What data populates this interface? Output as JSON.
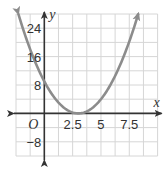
{
  "chart_data": {
    "type": "line",
    "title": "",
    "xlabel": "x",
    "ylabel": "y",
    "origin_label": "O",
    "xlim": [
      -2.5,
      10
    ],
    "ylim": [
      -12,
      28
    ],
    "x_grid_step": 1.25,
    "y_grid_step": 4,
    "grid": true,
    "x_ticks": [
      {
        "value": 2.5,
        "label": "2.5"
      },
      {
        "value": 5,
        "label": "5"
      },
      {
        "value": 7.5,
        "label": "7.5"
      }
    ],
    "y_ticks": [
      {
        "value": 24,
        "label": "24"
      },
      {
        "value": 16,
        "label": "16"
      },
      {
        "value": 8,
        "label": "8"
      },
      {
        "value": -8,
        "label": "-8"
      }
    ],
    "series": [
      {
        "name": "parabola",
        "equation": "y = (x - 3)^2",
        "vertex": [
          3,
          0
        ],
        "y_intercept": 9,
        "x": [
          -2.3,
          -2,
          -1,
          0,
          1,
          2,
          3,
          4,
          5,
          6,
          7,
          8,
          8.3
        ],
        "values": [
          28.09,
          25,
          16,
          9,
          4,
          1,
          0,
          1,
          4,
          9,
          16,
          25,
          28.09
        ],
        "color": "#8c8c8c",
        "arrows_both_ends": true
      }
    ],
    "colors": {
      "grid": "#d6d6d6",
      "axis": "#333333",
      "curve": "#8c8c8c"
    }
  }
}
